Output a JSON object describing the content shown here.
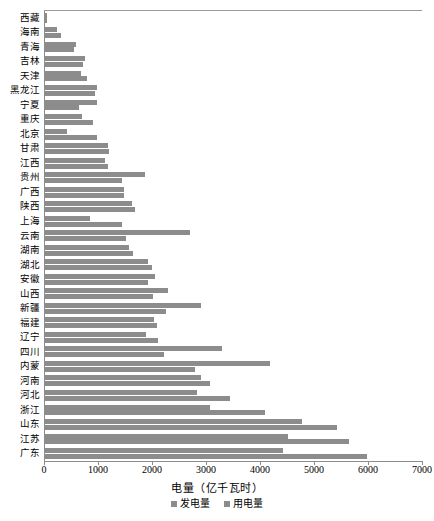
{
  "chart_data": {
    "type": "bar",
    "orientation": "horizontal",
    "title": "",
    "xlabel": "电量（亿千瓦时）",
    "ylabel": "",
    "xlim": [
      0,
      7000
    ],
    "xticks": [
      0,
      1000,
      2000,
      3000,
      4000,
      5000,
      6000,
      7000
    ],
    "grid": false,
    "legend_position": "bottom",
    "colors": {
      "generation": "#8c8c8c",
      "consumption": "#8c8c8c",
      "axis": "#8c8c8c"
    },
    "categories": [
      "西藏",
      "海南",
      "青海",
      "吉林",
      "天津",
      "黑龙江",
      "宁夏",
      "重庆",
      "北京",
      "甘肃",
      "江西",
      "贵州",
      "广西",
      "陕西",
      "上海",
      "云南",
      "湖南",
      "湖北",
      "安徽",
      "山西",
      "新疆",
      "福建",
      "辽宁",
      "四川",
      "内蒙",
      "河南",
      "河北",
      "浙江",
      "山东",
      "江苏",
      "广东"
    ],
    "series": [
      {
        "name": "发电量",
        "values": [
          60,
          240,
          600,
          760,
          680,
          980,
          980,
          700,
          420,
          1190,
          1130,
          1870,
          1480,
          1630,
          850,
          2700,
          1580,
          1920,
          2060,
          2300,
          2900,
          2040,
          1890,
          3300,
          4180,
          2900,
          2830,
          3070,
          4780,
          4520,
          4430
        ]
      },
      {
        "name": "用电量",
        "values": [
          50,
          320,
          560,
          720,
          790,
          940,
          640,
          900,
          990,
          1200,
          1190,
          1450,
          1480,
          1690,
          1450,
          1520,
          1640,
          2000,
          1930,
          2020,
          2260,
          2100,
          2110,
          2230,
          2800,
          3070,
          3440,
          4100,
          5420,
          5650,
          5990
        ]
      }
    ]
  },
  "legend": {
    "items": [
      {
        "label": "发电量",
        "color": "#8c8c8c"
      },
      {
        "label": "用电量",
        "color": "#8c8c8c"
      }
    ]
  }
}
